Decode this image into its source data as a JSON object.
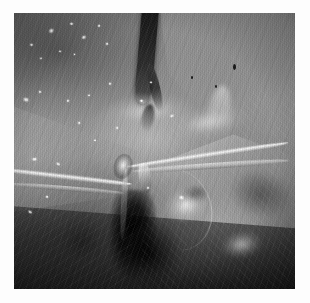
{
  "document": {
    "background_color": "#ffffff",
    "canvas_width": 310,
    "canvas_height": 303
  },
  "figure": {
    "name": "surgical-endoscopic-photograph",
    "modality": "endoscopic/laparoscopic video still",
    "color_mode": "grayscale",
    "caption": "",
    "frame": {
      "left": 14,
      "top": 13,
      "width": 281,
      "height": 276,
      "border_color": "#ffffff"
    },
    "tonal_palette": {
      "darkest": "#050505",
      "dark": "#2a2a2a",
      "mid_dark": "#5a5a5a",
      "mid": "#8a8a8a",
      "mid_light": "#b2b2b2",
      "light": "#d8d8d8",
      "specular": "#ffffff"
    },
    "regions": [
      {
        "id": "upper-left-tissue",
        "label": "Dark granular tissue with specular droplets",
        "tone": "mid_dark"
      },
      {
        "id": "upper-right-tissue",
        "label": "Fibrous tissue plane, striated",
        "tone": "mid"
      },
      {
        "id": "central-bright-band",
        "label": "Bright dissected tissue band",
        "tone": "light"
      },
      {
        "id": "lower-right-dome",
        "label": "Rounded bright organ surface",
        "tone": "mid_light"
      },
      {
        "id": "bottom-center-cavity",
        "label": "Deep dark cavity / shadowed recess",
        "tone": "darkest"
      },
      {
        "id": "lower-left-field",
        "label": "Shadowed tissue fan with fiber striations",
        "tone": "dark"
      }
    ],
    "structures": [
      {
        "id": "vessel-main",
        "label": "Dark vessel / duct running vertically",
        "position": "upper center",
        "tone": "darkest"
      },
      {
        "id": "vessel-branch",
        "label": "Vessel branch",
        "position": "upper center-right",
        "tone": "dark"
      },
      {
        "id": "strand-right-long",
        "label": "Bright instrument / suture strand, right sweep",
        "position": "mid right",
        "tone": "specular"
      },
      {
        "id": "strand-left-long",
        "label": "Bright instrument / suture strand, left sweep",
        "position": "mid left",
        "tone": "specular"
      },
      {
        "id": "strand-knot",
        "label": "Convergence / knot point of strands",
        "position": "center",
        "tone": "light"
      },
      {
        "id": "strand-descend",
        "label": "Descending strand into cavity",
        "position": "center below",
        "tone": "mid_light"
      },
      {
        "id": "clip-upper",
        "label": "Clip / tip highlight",
        "position": "center right of knot",
        "tone": "light"
      }
    ],
    "speculars": [
      {
        "x": 12.0,
        "y": 5.5,
        "w": 2.6,
        "h": 2.2
      },
      {
        "x": 19.5,
        "y": 3.2,
        "w": 1.8,
        "h": 1.6
      },
      {
        "x": 24.0,
        "y": 7.8,
        "w": 2.2,
        "h": 1.8
      },
      {
        "x": 29.5,
        "y": 4.0,
        "w": 1.6,
        "h": 1.4
      },
      {
        "x": 32.5,
        "y": 10.5,
        "w": 1.5,
        "h": 1.3
      },
      {
        "x": 5.5,
        "y": 11.0,
        "w": 1.8,
        "h": 1.5
      },
      {
        "x": 9.0,
        "y": 16.0,
        "w": 1.4,
        "h": 1.2
      },
      {
        "x": 15.5,
        "y": 13.5,
        "w": 1.3,
        "h": 1.2
      },
      {
        "x": 21.0,
        "y": 14.5,
        "w": 1.2,
        "h": 1.1
      },
      {
        "x": 3.0,
        "y": 30.5,
        "w": 2.8,
        "h": 2.0
      },
      {
        "x": 8.5,
        "y": 28.0,
        "w": 1.6,
        "h": 1.4
      },
      {
        "x": 18.5,
        "y": 31.0,
        "w": 1.5,
        "h": 1.3
      },
      {
        "x": 26.0,
        "y": 29.5,
        "w": 1.4,
        "h": 1.2
      },
      {
        "x": 33.5,
        "y": 25.0,
        "w": 1.6,
        "h": 1.3
      },
      {
        "x": 6.0,
        "y": 52.0,
        "w": 2.4,
        "h": 1.8
      },
      {
        "x": 14.5,
        "y": 54.0,
        "w": 2.0,
        "h": 1.6
      },
      {
        "x": 11.0,
        "y": 66.0,
        "w": 1.6,
        "h": 1.3
      },
      {
        "x": 4.5,
        "y": 71.5,
        "w": 2.0,
        "h": 1.5
      },
      {
        "x": 28.0,
        "y": 45.5,
        "w": 1.4,
        "h": 1.2
      },
      {
        "x": 36.0,
        "y": 41.0,
        "w": 1.5,
        "h": 1.3
      },
      {
        "x": 44.5,
        "y": 31.0,
        "w": 1.8,
        "h": 1.4
      },
      {
        "x": 55.0,
        "y": 36.5,
        "w": 2.2,
        "h": 1.6
      },
      {
        "x": 48.0,
        "y": 24.5,
        "w": 1.3,
        "h": 1.1
      },
      {
        "x": 22.5,
        "y": 39.0,
        "w": 1.6,
        "h": 1.3
      },
      {
        "x": 58.5,
        "y": 66.0,
        "w": 2.6,
        "h": 2.0
      },
      {
        "x": 47.0,
        "y": 62.5,
        "w": 1.5,
        "h": 1.3
      }
    ],
    "dark_flecks": [
      {
        "x": 78.0,
        "y": 18.5,
        "w": 1.0,
        "h": 2.0
      },
      {
        "x": 71.5,
        "y": 26.0,
        "w": 0.8,
        "h": 1.2
      },
      {
        "x": 63.0,
        "y": 23.0,
        "w": 0.7,
        "h": 1.0
      }
    ]
  }
}
